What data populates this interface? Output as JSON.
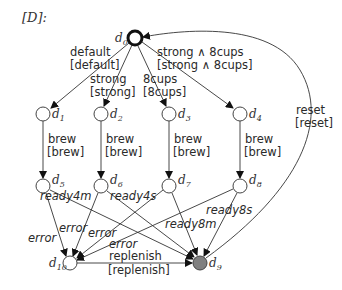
{
  "title": "[D]:",
  "nodes": [
    {
      "id": "d0",
      "label": "d",
      "sub": "0",
      "x": 135,
      "y": 38,
      "type": "initial"
    },
    {
      "id": "d1",
      "label": "d",
      "sub": "1",
      "x": 43,
      "y": 114,
      "type": "normal"
    },
    {
      "id": "d2",
      "label": "d",
      "sub": "2",
      "x": 101,
      "y": 114,
      "type": "normal"
    },
    {
      "id": "d3",
      "label": "d",
      "sub": "3",
      "x": 169,
      "y": 114,
      "type": "normal"
    },
    {
      "id": "d4",
      "label": "d",
      "sub": "4",
      "x": 240,
      "y": 114,
      "type": "normal"
    },
    {
      "id": "d5",
      "label": "d",
      "sub": "5",
      "x": 43,
      "y": 186,
      "type": "normal"
    },
    {
      "id": "d6",
      "label": "d",
      "sub": "6",
      "x": 101,
      "y": 186,
      "type": "normal"
    },
    {
      "id": "d7",
      "label": "d",
      "sub": "7",
      "x": 169,
      "y": 186,
      "type": "normal"
    },
    {
      "id": "d8",
      "label": "d",
      "sub": "8",
      "x": 240,
      "y": 186,
      "type": "normal"
    },
    {
      "id": "d10",
      "label": "d",
      "sub": "10",
      "x": 70,
      "y": 263,
      "type": "normal"
    },
    {
      "id": "d9",
      "label": "d",
      "sub": "9",
      "x": 200,
      "y": 263,
      "type": "final"
    }
  ],
  "edges": [
    {
      "from": "d0",
      "to": "d1",
      "label": "default",
      "guard": "[default]"
    },
    {
      "from": "d0",
      "to": "d2",
      "label": "strong",
      "guard": "[strong]"
    },
    {
      "from": "d0",
      "to": "d3",
      "label": "8cups",
      "guard": "[8cups]"
    },
    {
      "from": "d0",
      "to": "d4",
      "label": "strong ∧ 8cups",
      "guard": "[strong ∧ 8cups]"
    },
    {
      "from": "d1",
      "to": "d5",
      "label": "brew",
      "guard": "[brew]"
    },
    {
      "from": "d2",
      "to": "d6",
      "label": "brew",
      "guard": "[brew]"
    },
    {
      "from": "d3",
      "to": "d7",
      "label": "brew",
      "guard": "[brew]"
    },
    {
      "from": "d4",
      "to": "d8",
      "label": "brew",
      "guard": "[brew]"
    },
    {
      "from": "d5",
      "to": "d9",
      "label": "ready4m"
    },
    {
      "from": "d6",
      "to": "d9",
      "label": "ready4s"
    },
    {
      "from": "d7",
      "to": "d9",
      "label": "ready8m"
    },
    {
      "from": "d8",
      "to": "d9",
      "label": "ready8s"
    },
    {
      "from": "d5",
      "to": "d10",
      "label": "error"
    },
    {
      "from": "d6",
      "to": "d10",
      "label": "error"
    },
    {
      "from": "d7",
      "to": "d10",
      "label": "error"
    },
    {
      "from": "d8",
      "to": "d10",
      "label": "error"
    },
    {
      "from": "d10",
      "to": "d9",
      "label": "replenish",
      "guard": "[replenish]"
    },
    {
      "from": "d9",
      "to": "d0",
      "label": "reset",
      "guard": "[reset]"
    }
  ],
  "labels": {
    "title": "[D]:",
    "default": "default",
    "default_g": "[default]",
    "strong": "strong",
    "strong_g": "[strong]",
    "cups8": "8cups",
    "cups8_g": "[8cups]",
    "strong8": "strong ∧ 8cups",
    "strong8_g": "[strong ∧ 8cups]",
    "brew": "brew",
    "brew_g": "[brew]",
    "ready4m": "ready4m",
    "ready4s": "ready4s",
    "ready8m": "ready8m",
    "ready8s": "ready8s",
    "error": "error",
    "replenish": "replenish",
    "replenish_g": "[replenish]",
    "reset": "reset",
    "reset_g": "[reset]",
    "d": "d",
    "s0": "0",
    "s1": "1",
    "s2": "2",
    "s3": "3",
    "s4": "4",
    "s5": "5",
    "s6": "6",
    "s7": "7",
    "s8": "8",
    "s9": "9",
    "s10": "10"
  }
}
